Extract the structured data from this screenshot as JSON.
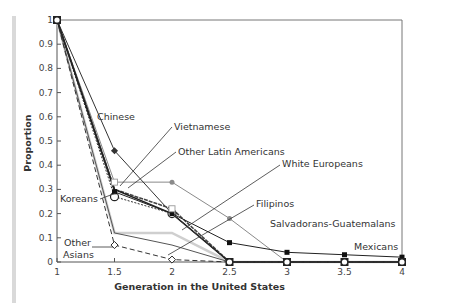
{
  "chart_data": {
    "type": "line",
    "title": "",
    "xlabel": "Generation in the United States",
    "ylabel": "Proportion",
    "x": [
      1,
      1.5,
      2,
      2.5,
      3,
      3.5,
      4
    ],
    "xticks": [
      "1",
      "1.5",
      "2",
      "2.5",
      "3",
      "3.5",
      "4"
    ],
    "yticks": [
      "0",
      "0.1",
      "0.2",
      "0.3",
      "0.4",
      "0.5",
      "0.6",
      "0.7",
      "0.8",
      "0.9",
      "1"
    ],
    "xlim": [
      1,
      4
    ],
    "ylim": [
      0,
      1
    ],
    "grid": false,
    "legend_position": "inline annotations",
    "series": [
      {
        "name": "Chinese",
        "values": [
          1,
          0.46,
          0.2,
          0,
          0,
          0,
          0
        ]
      },
      {
        "name": "Vietnamese",
        "values": [
          1,
          0.3,
          0.2,
          0,
          0,
          0,
          0
        ]
      },
      {
        "name": "Other Latin Americans",
        "values": [
          1,
          0.33,
          0.33,
          0.18,
          0,
          0,
          0
        ]
      },
      {
        "name": "Mexicans",
        "values": [
          1,
          0.29,
          0.2,
          0.08,
          0.04,
          0.03,
          0.02
        ]
      },
      {
        "name": "Salvadorans-Guatemalans",
        "values": [
          1,
          0.3,
          0.22,
          0,
          0,
          0,
          0
        ]
      },
      {
        "name": "Koreans",
        "values": [
          1,
          0.27,
          0.2,
          0,
          0,
          0,
          0
        ]
      },
      {
        "name": "White Europeans",
        "values": [
          1,
          0.12,
          0.12,
          0,
          0,
          0,
          0
        ]
      },
      {
        "name": "Filipinos",
        "values": [
          1,
          0.12,
          0.07,
          0,
          0,
          0,
          0
        ]
      },
      {
        "name": "Other Asians",
        "values": [
          1,
          0.07,
          0.01,
          0,
          0,
          0,
          0
        ]
      }
    ],
    "annotations": [
      "Chinese",
      "Vietnamese",
      "Other Latin Americans",
      "White Europeans",
      "Koreans",
      "Filipinos",
      "Salvadorans-Guatemalans",
      "Other",
      "Asians",
      "Mexicans"
    ]
  },
  "labels": {
    "chinese": "Chinese",
    "vietnamese": "Vietnamese",
    "other_latin": "Other Latin Americans",
    "white_europeans": "White Europeans",
    "koreans": "Koreans",
    "filipinos": "Filipinos",
    "salv_guat": "Salvadorans-Guatemalans",
    "other_asians_1": "Other",
    "other_asians_2": "Asians",
    "mexicans": "Mexicans"
  }
}
